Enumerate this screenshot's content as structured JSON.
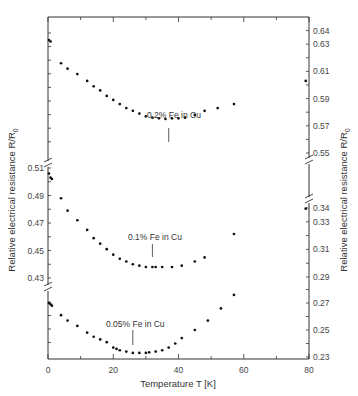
{
  "chart_data": {
    "type": "scatter",
    "title": "",
    "xlabel": "Temperature T [K]",
    "ylabel_left": "Relative electrical resistance R/R0",
    "ylabel_right": "Relative electrical resistance R/R0",
    "xlim": [
      0,
      80
    ],
    "x_ticks": [
      0,
      20,
      40,
      60,
      80
    ],
    "x_tick_labels": [
      "0",
      "20",
      "40",
      "60",
      "80"
    ],
    "left_y_tick_labels": [
      "0.51",
      "0.49",
      "0.47",
      "0.45",
      "0.43"
    ],
    "right_y_tick_labels": [
      "0.64",
      "0.63",
      "0.61",
      "0.59",
      "0.57",
      "0.55",
      "0.34",
      "0.33",
      "0.31",
      "0.29",
      "0.27",
      "0.25",
      "0.23"
    ],
    "grid": false,
    "legend": "none (inline series labels)",
    "series": [
      {
        "name": "0.2% Fe in Cu",
        "axis": "right",
        "ylim": [
          0.55,
          0.645
        ],
        "minimum_marker_T": 37,
        "points": [
          [
            0.3,
            0.633
          ],
          [
            0.8,
            0.632
          ],
          [
            4,
            0.616
          ],
          [
            6,
            0.612
          ],
          [
            9,
            0.608
          ],
          [
            12,
            0.603
          ],
          [
            14,
            0.599
          ],
          [
            16,
            0.596
          ],
          [
            18,
            0.592
          ],
          [
            20,
            0.589
          ],
          [
            22,
            0.586
          ],
          [
            24,
            0.583
          ],
          [
            26,
            0.581
          ],
          [
            28,
            0.579
          ],
          [
            30,
            0.577
          ],
          [
            32,
            0.576
          ],
          [
            34,
            0.5755
          ],
          [
            36,
            0.575
          ],
          [
            38,
            0.5755
          ],
          [
            40,
            0.5755
          ],
          [
            42,
            0.576
          ],
          [
            45,
            0.578
          ],
          [
            48,
            0.581
          ],
          [
            52,
            0.583
          ],
          [
            57,
            0.586
          ],
          [
            79,
            0.603
          ]
        ]
      },
      {
        "name": "0.1% Fe in Cu",
        "axis": "left_mid / right_mid",
        "ylim_left": [
          0.43,
          0.51
        ],
        "ylim_right": [
          0.29,
          0.34
        ],
        "minimum_marker_T": 32,
        "points": [
          [
            0.3,
            0.506
          ],
          [
            0.8,
            0.503
          ],
          [
            1.2,
            0.502
          ],
          [
            4,
            0.488
          ],
          [
            6,
            0.479
          ],
          [
            9,
            0.472
          ],
          [
            12,
            0.465
          ],
          [
            14,
            0.459
          ],
          [
            16,
            0.455
          ],
          [
            18,
            0.451
          ],
          [
            20,
            0.447
          ],
          [
            22,
            0.444
          ],
          [
            24,
            0.442
          ],
          [
            26,
            0.44
          ],
          [
            28,
            0.439
          ],
          [
            30,
            0.438
          ],
          [
            32,
            0.438
          ],
          [
            33,
            0.438
          ],
          [
            35,
            0.438
          ],
          [
            38,
            0.438
          ],
          [
            41,
            0.439
          ],
          [
            45,
            0.442
          ],
          [
            48,
            0.445
          ],
          [
            57,
            0.462
          ],
          [
            79,
            0.3395
          ]
        ]
      },
      {
        "name": "0.05% Fe in Cu",
        "axis": "right",
        "ylim": [
          0.23,
          0.275
        ],
        "minimum_marker_T": 26,
        "points": [
          [
            0.3,
            0.27
          ],
          [
            0.8,
            0.269
          ],
          [
            1.2,
            0.268
          ],
          [
            4,
            0.261
          ],
          [
            6,
            0.257
          ],
          [
            9,
            0.253
          ],
          [
            12,
            0.248
          ],
          [
            14,
            0.245
          ],
          [
            16,
            0.243
          ],
          [
            18,
            0.241
          ],
          [
            20,
            0.237
          ],
          [
            21,
            0.236
          ],
          [
            22,
            0.235
          ],
          [
            24,
            0.234
          ],
          [
            26,
            0.233
          ],
          [
            28,
            0.233
          ],
          [
            30,
            0.233
          ],
          [
            31,
            0.2335
          ],
          [
            33,
            0.234
          ],
          [
            35,
            0.235
          ],
          [
            37,
            0.237
          ],
          [
            39,
            0.24
          ],
          [
            41,
            0.244
          ],
          [
            45,
            0.25
          ],
          [
            49,
            0.257
          ],
          [
            53,
            0.266
          ],
          [
            57,
            0.276
          ]
        ]
      }
    ]
  },
  "labels": {
    "series_0": "0.2% Fe in Cu",
    "series_1": "0.1% Fe in Cu",
    "series_2": "0.05% Fe in Cu",
    "xlabel": "Temperature T [K]",
    "ylabel_left": "Relative electrical resistance R/R",
    "ylabel_left_sub": "0",
    "ylabel_right": "Relative electrical resistance R/R",
    "ylabel_right_sub": "0"
  }
}
